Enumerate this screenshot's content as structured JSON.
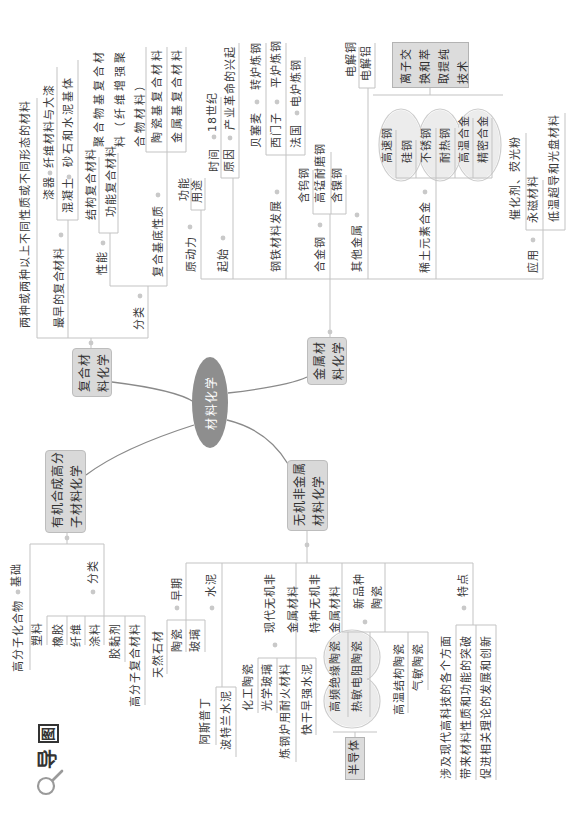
{
  "title": {
    "dao": "导",
    "tu": "图",
    "icon": "magnifier-icon"
  },
  "center": {
    "label": "材料化学"
  },
  "composite": {
    "title_lines": [
      "复合材",
      "料化学"
    ],
    "definition": "两种或两种以上不同性质或不同形态的材料",
    "earliest": {
      "label": "最早的复合材料",
      "items": [
        {
          "label": "漆器",
          "detail": "纤维材料与大漆"
        },
        {
          "label": "混凝土",
          "detail": "砂石和水泥基体"
        }
      ]
    },
    "classification": {
      "label": "分类",
      "performance": {
        "label": "性能",
        "items": [
          "结构复合材料",
          "功能复合材料"
        ]
      },
      "matrix": {
        "label": "复合基底性质",
        "items": [
          {
            "label": "聚合物基复合材料（纤维增强聚合物材料）",
            "lines": [
              "聚合物基复合材",
              "料（纤维增强聚",
              "合物材料）"
            ]
          },
          {
            "label": "陶瓷基复合材料"
          },
          {
            "label": "金属基复合材料"
          }
        ]
      }
    }
  },
  "metal": {
    "title_lines": [
      "金属材",
      "料化学"
    ],
    "driving_force": {
      "label": "原动力",
      "items": [
        "功能",
        "用途"
      ]
    },
    "origin": {
      "label": "起始",
      "items": [
        {
          "label": "时间",
          "detail": "18世纪"
        },
        {
          "label": "原因",
          "detail": "产业革命的兴起"
        }
      ]
    },
    "steel_development": {
      "label": "钢铁材料发展",
      "items": [
        {
          "label": "贝塞麦",
          "detail": "转炉炼钢"
        },
        {
          "label": "西门子",
          "detail": "平炉炼钢"
        },
        {
          "label": "法国",
          "detail": "电炉炼钢"
        }
      ]
    },
    "alloy_steel": {
      "label": "合金钢",
      "items": [
        "含钨钢",
        "高锰耐磨钢",
        "含镍钢"
      ]
    },
    "other_metals": {
      "label": "其他金属",
      "items": [
        "电解铜",
        "电解铝"
      ]
    },
    "rare_earth_alloys": {
      "label": "稀土元素合金",
      "items": [
        "高速钢",
        "硅钢",
        "不锈钢",
        "耐热钢",
        "高温合金",
        "精密合金"
      ],
      "summary": "离子交换和萃取提纯技术",
      "summary_lines": [
        "离子交",
        "换和萃",
        "取提纯",
        "技术"
      ]
    },
    "applications": {
      "label": "应用",
      "items": [
        "催化剂、荧光粉",
        "永磁材料",
        "低温超导和光盘材料"
      ]
    }
  },
  "organic": {
    "title_lines": [
      "有机合成高分",
      "子材料化学"
    ],
    "basis": {
      "label": "基础",
      "items": [
        "高分子化合物"
      ]
    },
    "classification": {
      "label": "分类",
      "items": [
        "塑料",
        "橡胶",
        "纤维",
        "涂料",
        "胶黏剂",
        "高分子复合材料"
      ]
    }
  },
  "inorganic": {
    "title_lines": [
      "无机非金属",
      "材料化学"
    ],
    "early": {
      "label": "早期",
      "items": [
        "天然石材",
        "陶瓷",
        "玻璃"
      ]
    },
    "cement": {
      "label": "水泥",
      "items": [
        "阿斯普丁",
        "波特兰水泥"
      ]
    },
    "modern": {
      "label_lines": [
        "现代无机非",
        "金属材料"
      ],
      "items": [
        "化工陶瓷",
        "光学玻璃",
        "炼钢炉用耐火材料",
        "快干早强水泥"
      ]
    },
    "special": {
      "label_lines": [
        "特种无机非",
        "金属材料"
      ]
    },
    "new_ceramics": {
      "label_lines": [
        "新品种",
        "陶瓷"
      ],
      "items": [
        "高频绝缘陶瓷",
        "热敏电阻陶瓷",
        "高温结构陶瓷",
        "气敏陶瓷"
      ],
      "summary": "半导体"
    },
    "features": {
      "label": "特点",
      "items": [
        "涉及现代高科技的各个方面",
        "带来材料性质和功能的突破",
        "促进相关理论的发展和创新"
      ]
    }
  },
  "colors": {
    "topic_fill": "#d9d9d9",
    "center_fill": "#8e8e8e",
    "line": "#c3c3c3",
    "main_curve": "#8a8a8a",
    "cloud_fill": "#ececec"
  }
}
